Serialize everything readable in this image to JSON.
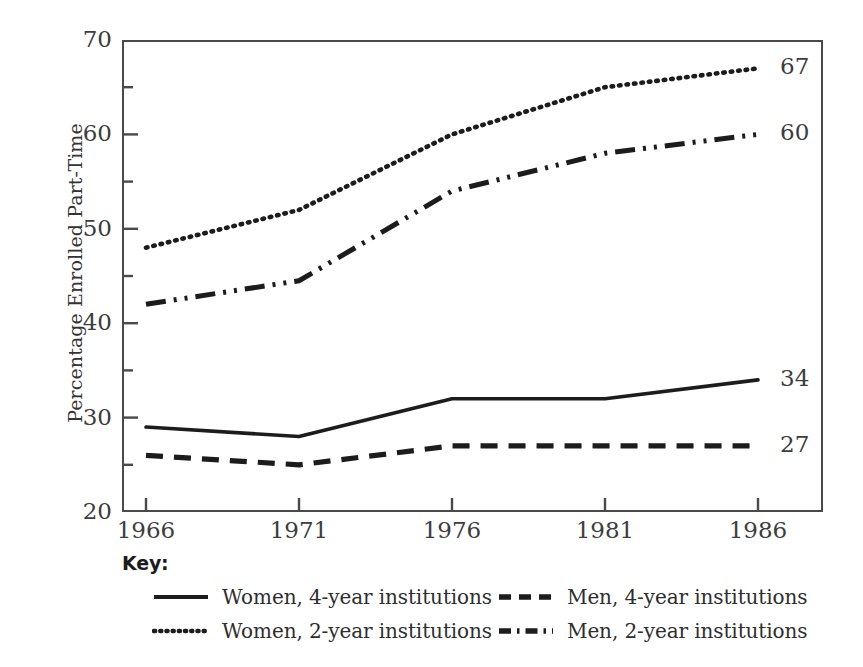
{
  "chart_data": {
    "type": "line",
    "title": "",
    "xlabel": "",
    "ylabel": "Percentage Enrolled Part-Time",
    "x": [
      1966,
      1971,
      1976,
      1981,
      1986
    ],
    "xtick_labels": [
      "1966",
      "1971",
      "1976",
      "1981",
      "1986"
    ],
    "ytick_labels": [
      "20",
      "30",
      "40",
      "50",
      "60",
      "70"
    ],
    "ytick_values": [
      20,
      30,
      40,
      50,
      60,
      70
    ],
    "yminor_values": [
      25,
      35,
      45,
      55,
      65
    ],
    "xlim": [
      1964.5,
      1987.5
    ],
    "ylim": [
      20,
      70
    ],
    "grid": false,
    "legend_position": "below",
    "series": [
      {
        "name": "Women, 4-year institutions",
        "key": "women-4-year",
        "style": "solid",
        "values": [
          29,
          28,
          32,
          32,
          34
        ],
        "end_label": "34"
      },
      {
        "name": "Women, 2-year institutions",
        "key": "women-2-year",
        "style": "dotted",
        "values": [
          48,
          52,
          60,
          65,
          67
        ],
        "end_label": "67"
      },
      {
        "name": "Men, 4-year institutions",
        "key": "men-4-year",
        "style": "dashed",
        "values": [
          26,
          25,
          27,
          27,
          27
        ],
        "end_label": "27"
      },
      {
        "name": "Men, 2-year institutions",
        "key": "men-2-year",
        "style": "dash-dot",
        "values": [
          42,
          44.5,
          54,
          58,
          60
        ],
        "end_label": "60"
      }
    ]
  },
  "legend": {
    "title": "Key:",
    "items": [
      {
        "label": "Women, 4-year institutions",
        "style": "solid"
      },
      {
        "label": "Men, 4-year institutions",
        "style": "dashed"
      },
      {
        "label": "Women, 2-year institutions",
        "style": "dotted"
      },
      {
        "label": "Men, 2-year institutions",
        "style": "dash-dot"
      }
    ]
  },
  "colors": {
    "line": "#1c1c1c",
    "axis": "#4a4a4a",
    "text": "#3d3d3d",
    "background": "#ffffff"
  }
}
